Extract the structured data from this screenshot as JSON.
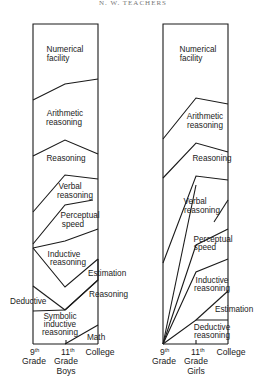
{
  "header": {
    "text": "N. W. TEACHERS"
  },
  "panels": [
    {
      "id": "boys",
      "group_label": "Boys",
      "x_axis": [
        "9th Grade",
        "11th Grade",
        "College"
      ],
      "bands_top_to_bottom": [
        "Numerical facility",
        "Arithmetic reasoning",
        "Reasoning",
        "Verbal reasoning",
        "Perceptual speed",
        "Inductive reasoning",
        "Estimation",
        "Reasoning",
        "Deductive",
        "Symbolic inductive reasoning",
        "Math"
      ],
      "labels": {
        "numerical_1": "Numerical",
        "numerical_2": "facility",
        "arith_1": "Arithmetic",
        "arith_2": "reasoning",
        "reasoning": "Reasoning",
        "verbal_1": "Verbal",
        "verbal_2": "reasoning",
        "perceptual_1": "Perceptual",
        "perceptual_2": "speed",
        "inductive_1": "Inductive",
        "inductive_2": "reasoning",
        "estimation": "Estimation",
        "reasoning2": "Reasoning",
        "deductive": "Deductive",
        "symbolic_1": "Symbolic",
        "symbolic_2": "inductive",
        "symbolic_3": "reasoning",
        "math": "Math"
      },
      "axis": {
        "t1_num": "9",
        "t1_sup": "th",
        "t1_word": "Grade",
        "t2_num": "11",
        "t2_sup": "th",
        "t2_word": "Grade",
        "t3": "College",
        "group": "Boys"
      }
    },
    {
      "id": "girls",
      "group_label": "Girls",
      "x_axis": [
        "9th Grade",
        "11th Grade",
        "College"
      ],
      "bands_top_to_bottom": [
        "Numerical facility",
        "Arithmetic reasoning",
        "Reasoning",
        "Verbal reasoning",
        "Perceptual speed",
        "Inductive reasoning",
        "Estimation",
        "Deductive reasoning"
      ],
      "labels": {
        "numerical_1": "Numerical",
        "numerical_2": "facility",
        "arith_1": "Arithmetic",
        "arith_2": "reasoning",
        "reasoning": "Reasoning",
        "verbal_1": "Verbal",
        "verbal_2": "reasoning",
        "perceptual_1": "Perceptual",
        "perceptual_2": "speed",
        "inductive_1": "Inductive",
        "inductive_2": "reasoning",
        "estimation": "Estimation",
        "deductive_1": "Deductive",
        "deductive_2": "reasoning"
      },
      "axis": {
        "t1_num": "9",
        "t1_sup": "th",
        "t1_word": "Grade",
        "t2_num": "11",
        "t2_sup": "th",
        "t2_word": "Grade",
        "t3": "College",
        "group": "Girls"
      }
    }
  ]
}
